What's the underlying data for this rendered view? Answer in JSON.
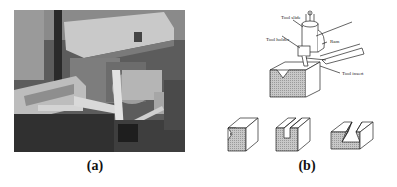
{
  "figure": {
    "panel_a": {
      "caption": "(a)",
      "description": "Photograph of a shaper machine with vise and ram"
    },
    "panel_b": {
      "caption": "(b)",
      "labels": {
        "tool_slide": "Tool slide",
        "tool_holder": "Tool holder",
        "ram": "Ram",
        "tool_insert": "Tool insert"
      },
      "shapes": [
        "dovetail-step",
        "t-slot",
        "dovetail-slot"
      ]
    }
  }
}
